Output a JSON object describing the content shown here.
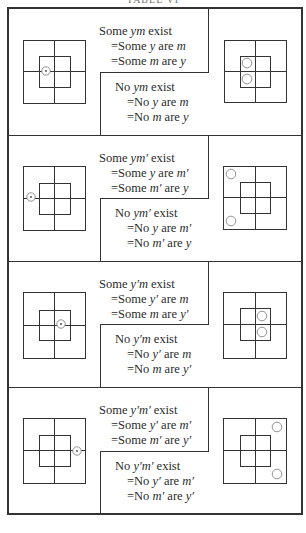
{
  "page": {
    "title": "TABLE VI"
  },
  "colors": {
    "line": "#333333",
    "circle": "#888888",
    "text": "#2b2b2b"
  },
  "frame": {
    "x": 8,
    "y": 8,
    "w": 294,
    "h": 506
  },
  "sections": [
    {
      "id": "ym",
      "y0": 8,
      "y1": 135,
      "some": {
        "line1": [
          "Some ",
          "ym",
          " exist"
        ],
        "line2": [
          "=Some ",
          "y",
          " are ",
          "m"
        ],
        "line3": [
          "=Some ",
          "m",
          " are ",
          "y"
        ]
      },
      "none": {
        "line1": [
          "No ",
          "ym",
          " exist"
        ],
        "line2": [
          "=No ",
          "y",
          " are ",
          "m"
        ],
        "line3": [
          "=No ",
          "m",
          " are ",
          "y"
        ]
      },
      "left_diagram": {
        "outer": [
          23,
          40,
          62,
          63
        ],
        "inner": [
          39,
          56,
          31,
          31
        ],
        "dot": [
          46,
          71
        ]
      },
      "right_diagram": {
        "outer": [
          224,
          40,
          62,
          62
        ],
        "inner": [
          240,
          56,
          30,
          31
        ],
        "circles": [
          [
            247,
            63
          ],
          [
            247,
            79
          ]
        ]
      }
    },
    {
      "id": "ym-prime",
      "y0": 135,
      "y1": 261,
      "some": {
        "line1": [
          "Some ",
          "ym′",
          " exist"
        ],
        "line2": [
          "=Some ",
          "y",
          " are ",
          "m′"
        ],
        "line3": [
          "=Some ",
          "m′",
          " are ",
          "y"
        ]
      },
      "none": {
        "line1": [
          "No ",
          "ym′",
          " exist"
        ],
        "line2": [
          "=No ",
          "y",
          " are ",
          "m′"
        ],
        "line3": [
          "=No ",
          "m′",
          " are ",
          "y"
        ]
      },
      "left_diagram": {
        "outer": [
          23,
          166,
          62,
          64
        ],
        "inner": [
          39,
          183,
          31,
          31
        ],
        "dot": [
          31,
          197
        ]
      },
      "right_diagram": {
        "outer": [
          223,
          166,
          63,
          63
        ],
        "inner": [
          240,
          182,
          30,
          31
        ],
        "circles": [
          [
            231,
            174
          ],
          [
            231,
            221
          ]
        ]
      }
    },
    {
      "id": "y-prime-m",
      "y0": 261,
      "y1": 387,
      "some": {
        "line1": [
          "Some ",
          "y′m",
          " exist"
        ],
        "line2": [
          "=Some ",
          "y′",
          " are ",
          "m"
        ],
        "line3": [
          "=Some ",
          "m",
          " are ",
          "y′"
        ]
      },
      "none": {
        "line1": [
          "No ",
          "y′m",
          " exist"
        ],
        "line2": [
          "=No ",
          "y′",
          " are ",
          "m"
        ],
        "line3": [
          "=No ",
          "m",
          " are ",
          "y′"
        ]
      },
      "left_diagram": {
        "outer": [
          23,
          292,
          62,
          66
        ],
        "inner": [
          39,
          310,
          31,
          30
        ],
        "dot": [
          61,
          324
        ]
      },
      "right_diagram": {
        "outer": [
          223,
          292,
          63,
          66
        ],
        "inner": [
          240,
          308,
          30,
          32
        ],
        "circles": [
          [
            262,
            316
          ],
          [
            262,
            332
          ]
        ]
      }
    },
    {
      "id": "y-prime-m-prime",
      "y0": 387,
      "y1": 514,
      "some": {
        "line1": [
          "Some ",
          "y′m′",
          " exist"
        ],
        "line2": [
          "=Some ",
          "y′",
          " are ",
          "m′"
        ],
        "line3": [
          "=Some ",
          "m′",
          " are ",
          "y′"
        ]
      },
      "none": {
        "line1": [
          "No ",
          "y′m′",
          " exist"
        ],
        "line2": [
          "=No ",
          "y′",
          " are ",
          "m′"
        ],
        "line3": [
          "=No ",
          "m′",
          " are ",
          "y′"
        ]
      },
      "left_diagram": {
        "outer": [
          23,
          418,
          62,
          65
        ],
        "inner": [
          39,
          435,
          31,
          31
        ],
        "dot": [
          77,
          451
        ]
      },
      "right_diagram": {
        "outer": [
          223,
          418,
          63,
          65
        ],
        "inner": [
          240,
          435,
          30,
          31
        ],
        "circles": [
          [
            277,
            427
          ],
          [
            277,
            474
          ]
        ]
      }
    }
  ]
}
